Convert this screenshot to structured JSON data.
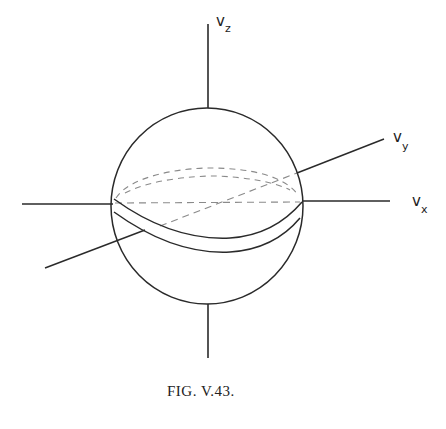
{
  "figure": {
    "caption": "Fig. V.43.",
    "caption_display": "FIG. V.43.",
    "axes": {
      "z": {
        "main": "v",
        "sub": "z"
      },
      "y": {
        "main": "v",
        "sub": "y"
      },
      "x": {
        "main": "v",
        "sub": "x"
      }
    },
    "colors": {
      "line": "#2a2a2a",
      "dashed": "#8a8a8a",
      "background": "#ffffff"
    }
  }
}
